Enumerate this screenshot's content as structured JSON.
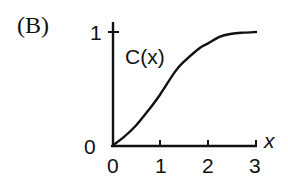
{
  "panel_label": "(B)",
  "chart_data": {
    "type": "line",
    "title": "",
    "panel": "(B)",
    "xlabel": "x",
    "ylabel": "",
    "xlim": [
      0,
      3
    ],
    "ylim": [
      0,
      1
    ],
    "x_ticks": [
      "0",
      "1",
      "2",
      "3"
    ],
    "y_ticks": [
      "0",
      "1"
    ],
    "grid": false,
    "legend": null,
    "annotations": [
      "C(x)"
    ],
    "series": [
      {
        "name": "C(x)",
        "x": [
          0,
          0.25,
          0.5,
          0.79,
          1.0,
          1.31,
          1.5,
          1.83,
          2.0,
          2.25,
          2.5,
          2.75,
          3.0
        ],
        "y": [
          0,
          0.08,
          0.18,
          0.33,
          0.45,
          0.65,
          0.74,
          0.86,
          0.9,
          0.96,
          0.985,
          0.995,
          1.0
        ]
      }
    ]
  },
  "labels": {
    "y_top": "1",
    "y_origin": "0",
    "x_0": "0",
    "x_1": "1",
    "x_2": "2",
    "x_3": "3",
    "x_var": "x",
    "curve": "C(x)"
  }
}
